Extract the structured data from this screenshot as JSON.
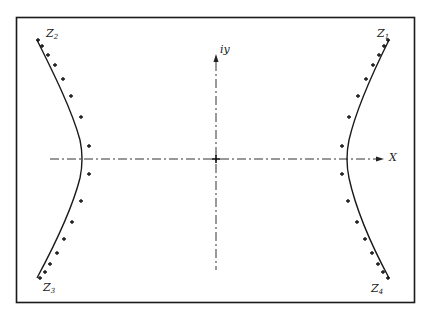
{
  "diagram": {
    "type": "hyperbola-in-complex-plane",
    "axes": {
      "horizontal_label": "X",
      "vertical_label": "iy"
    },
    "branch_labels": {
      "z1": {
        "base": "Z",
        "sub": "1"
      },
      "z2": {
        "base": "Z",
        "sub": "2"
      },
      "z3": {
        "base": "Z",
        "sub": "3"
      },
      "z4": {
        "base": "Z",
        "sub": "4"
      }
    },
    "colors": {
      "ink": "#1a1a1a",
      "background": "#ffffff"
    }
  }
}
